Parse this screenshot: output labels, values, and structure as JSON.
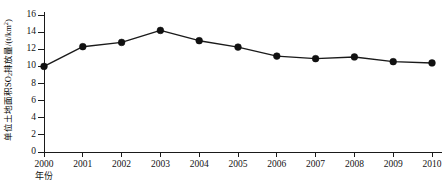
{
  "chart_data": {
    "type": "line",
    "title": "",
    "subtitle": "",
    "xlabel": "年份",
    "ylabel": "单位土地面积SO2排放量/(t/km2)",
    "ylabel_parts": {
      "prefix": "单位土地面积SO",
      "sub": "2",
      "middle": "排放量/(t/km",
      "sup": "2",
      "suffix": ")"
    },
    "categories": [
      "2000",
      "2001",
      "2002",
      "2003",
      "2004",
      "2005",
      "2006",
      "2007",
      "2008",
      "2009",
      "2010"
    ],
    "x": [
      2000,
      2001,
      2002,
      2003,
      2004,
      2005,
      2006,
      2007,
      2008,
      2009,
      2010
    ],
    "values": [
      10.0,
      12.3,
      12.8,
      14.2,
      13.0,
      12.25,
      11.2,
      10.9,
      11.1,
      10.55,
      10.4
    ],
    "series": [
      {
        "name": "单位土地面积SO2排放量",
        "values": [
          10.0,
          12.3,
          12.8,
          14.2,
          13.0,
          12.25,
          11.2,
          10.9,
          11.1,
          10.55,
          10.4
        ]
      }
    ],
    "ylim": [
      0,
      16
    ],
    "xlim": [
      2000,
      2010
    ],
    "y_ticks": [
      0,
      2,
      4,
      6,
      8,
      10,
      12,
      14,
      16
    ],
    "y_tick_labels": [
      "0",
      "2",
      "4",
      "6",
      "8",
      "10",
      "12",
      "14",
      "16"
    ],
    "x_ticks": [
      2000,
      2001,
      2002,
      2003,
      2004,
      2005,
      2006,
      2007,
      2008,
      2009,
      2010
    ],
    "x_tick_labels": [
      "2000",
      "2001",
      "2002",
      "2003",
      "2004",
      "2005",
      "2006",
      "2007",
      "2008",
      "2009",
      "2010"
    ],
    "grid": false,
    "legend": false,
    "legend_position": "none",
    "marker": "filled-circle",
    "line_color": "#1a1a1a",
    "marker_color": "#111111",
    "background_color": "#ffffff",
    "axis_color": "#1a1a1a"
  }
}
